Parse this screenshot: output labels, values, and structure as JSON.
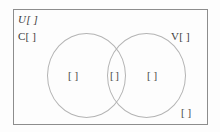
{
  "diagram": {
    "universe": {
      "label": "U[  ]",
      "name": "universal-set"
    },
    "sets": [
      {
        "name": "set-c",
        "label": "C[  ]"
      },
      {
        "name": "set-v",
        "label": "V[  ]"
      }
    ],
    "blanks": [
      {
        "name": "blank-c-only",
        "region": "C only",
        "label": "[   ]"
      },
      {
        "name": "blank-intersection",
        "region": "C and V",
        "label": "[  ]"
      },
      {
        "name": "blank-v-only",
        "region": "V only",
        "label": "[   ]"
      },
      {
        "name": "blank-outside",
        "region": "outside both",
        "label": "[   ]"
      }
    ],
    "colors": {
      "background": "#fdfdfd",
      "rectangle_border": "#8d8d8d",
      "circle_stroke": "#b4b4b4",
      "text": "#3b3b3b"
    }
  }
}
